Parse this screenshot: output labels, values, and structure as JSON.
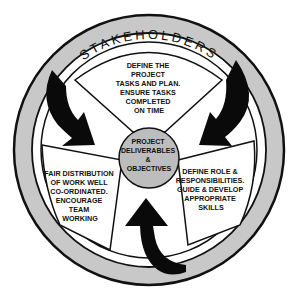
{
  "diagram": {
    "ring_label": "STAKEHOLDERS",
    "center": {
      "lines": [
        "PROJECT",
        "DELIVERABLES",
        "&",
        "OBJECTIVES"
      ]
    },
    "panels": [
      {
        "id": "top",
        "lines": [
          "DEFINE THE",
          "PROJECT",
          "TASKS AND PLAN.",
          "ENSURE TASKS",
          "COMPLETED",
          "ON TIME"
        ]
      },
      {
        "id": "left",
        "lines": [
          "FAIR DISTRIBUTION",
          "OF WORK WELL",
          "CO-ORDINATED.",
          "ENCOURAGE",
          "TEAM",
          "WORKING"
        ]
      },
      {
        "id": "right",
        "lines": [
          "DEFINE ROLE &",
          "RESPONSIBILITIES.",
          "GUIDE & DEVELOP",
          "APPROPRIATE",
          "SKILLS"
        ]
      }
    ],
    "arrows": [
      {
        "name": "left-arrow",
        "direction": "inward from stakeholder ring toward left panel"
      },
      {
        "name": "right-arrow",
        "direction": "inward from stakeholder ring toward right panel"
      },
      {
        "name": "bottom-arrow",
        "direction": "upward from stakeholder ring toward center"
      }
    ],
    "colors": {
      "ring_fill": "#c8c8c8",
      "line": "#111111",
      "center_fill": "#bdbdbd",
      "arrow": "#0a0a0a",
      "background": "#ffffff"
    }
  }
}
